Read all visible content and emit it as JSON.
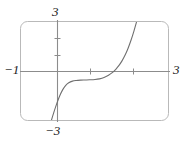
{
  "figure": {
    "title": "",
    "background_color": "#ffffff"
  },
  "chart_data": {
    "type": "line",
    "title": "",
    "xlabel": "",
    "ylabel": "",
    "xlim": [
      -1,
      3
    ],
    "ylim": [
      -3,
      3
    ],
    "grid": false,
    "legend": null,
    "frame": {
      "shape": "rounded-rectangle",
      "corner_radius": 6,
      "stroke_color": "#b9b9b9",
      "stroke_width": 1
    },
    "axes": {
      "x_axis": {
        "color": "#8c8c8c",
        "tick_values": [
          1,
          2
        ],
        "label_left": "-1",
        "label_right": "3"
      },
      "y_axis": {
        "color": "#8c8c8c",
        "tick_values": [
          1,
          2
        ],
        "label_top": "3",
        "label_bottom": "-3"
      }
    },
    "series": [
      {
        "name": "curve",
        "color": "#6f6f6f",
        "width": 1.1,
        "description": "cubic-like S curve with flat inflection plateau",
        "x": [
          -0.18,
          -0.1,
          -0.02,
          0.06,
          0.14,
          0.22,
          0.3,
          0.4,
          0.5,
          0.62,
          0.74,
          0.86,
          1.0,
          1.12,
          1.24,
          1.36,
          1.46,
          1.56,
          1.64,
          1.72,
          1.8,
          1.88,
          1.96,
          2.04,
          2.12
        ],
        "y": [
          -3.15,
          -2.55,
          -2.0,
          -1.52,
          -1.14,
          -0.88,
          -0.72,
          -0.62,
          -0.58,
          -0.56,
          -0.55,
          -0.54,
          -0.52,
          -0.48,
          -0.4,
          -0.26,
          -0.1,
          0.12,
          0.34,
          0.62,
          0.96,
          1.38,
          1.88,
          2.46,
          3.1
        ]
      }
    ]
  },
  "labels": {
    "y_max": "3",
    "y_min": "−3",
    "x_min": "−1",
    "x_max": "3"
  },
  "colors": {
    "frame": "#b9b9b9",
    "axis": "#8c8c8c",
    "curve": "#6f6f6f",
    "text": "#1a1a1a"
  }
}
